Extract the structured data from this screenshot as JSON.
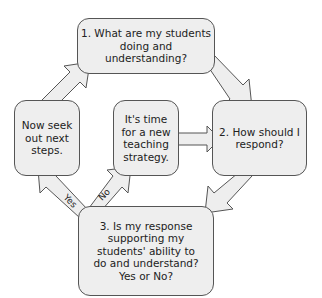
{
  "diagram": {
    "type": "cycle-flowchart",
    "nodes": [
      {
        "id": "q1",
        "label": "1. What are my students doing and understanding?"
      },
      {
        "id": "q2",
        "label": "2. How should I respond?"
      },
      {
        "id": "q3",
        "label": "3. Is my response supporting my students' ability to do and understand? Yes or No?"
      },
      {
        "id": "next",
        "label": "Now seek out next steps."
      },
      {
        "id": "new",
        "label": "It's time for a new teaching strategy."
      }
    ],
    "edges": [
      {
        "from": "q1",
        "to": "q2",
        "label": ""
      },
      {
        "from": "q2",
        "to": "q3",
        "label": ""
      },
      {
        "from": "q3",
        "to": "next",
        "label": "Yes"
      },
      {
        "from": "q3",
        "to": "new",
        "label": "No"
      },
      {
        "from": "new",
        "to": "q2",
        "label": ""
      },
      {
        "from": "next",
        "to": "q1",
        "label": ""
      }
    ],
    "colors": {
      "box_fill": "#eeeeee",
      "box_border": "#555555",
      "arrow_fill": "#eeeeee"
    }
  }
}
